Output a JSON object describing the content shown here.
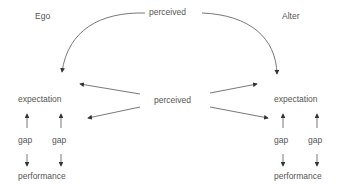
{
  "diagram": {
    "left_actor": "Ego",
    "right_actor": "Alter",
    "top_label": "perceived",
    "center_label": "perceived",
    "left": {
      "expectation": "expectation",
      "gap1": "gap",
      "gap2": "gap",
      "performance": "performance"
    },
    "right": {
      "expectation": "expectation",
      "gap1": "gap",
      "gap2": "gap",
      "performance": "performance"
    },
    "colors": {
      "text": "#555555",
      "line": "#444444"
    }
  }
}
